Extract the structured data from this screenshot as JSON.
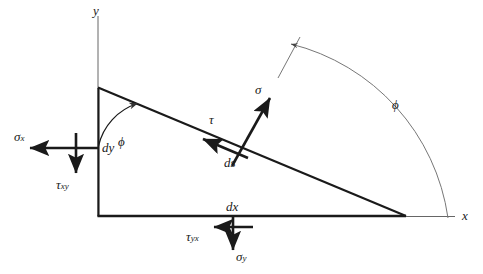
{
  "figure": {
    "kind": "stress-element-free-body-diagram",
    "background_color": "#ffffff",
    "line_color": "#1a1a1a",
    "thin_line_color": "#555555",
    "axes": {
      "y_label": "y",
      "x_label": "x"
    },
    "angles": {
      "vertex_angle_label": "ϕ",
      "arc_angle_label": "ϕ"
    },
    "edge_lengths": {
      "vertical_label": "dy",
      "horizontal_label": "dx",
      "hypotenuse_label": "ds"
    },
    "stresses": [
      {
        "name": "sigma-x",
        "symbol": "σ",
        "subscript": "x",
        "face": "left",
        "direction": "left"
      },
      {
        "name": "tau-xy",
        "symbol": "τ",
        "subscript": "xy",
        "face": "left",
        "direction": "down"
      },
      {
        "name": "sigma-y",
        "symbol": "σ",
        "subscript": "y",
        "face": "bottom",
        "direction": "down"
      },
      {
        "name": "tau-yx",
        "symbol": "τ",
        "subscript": "yx",
        "face": "bottom",
        "direction": "left"
      },
      {
        "name": "sigma-n",
        "symbol": "σ",
        "subscript": "",
        "face": "hypotenuse",
        "direction": "normal-outward"
      },
      {
        "name": "tau-nt",
        "symbol": "τ",
        "subscript": "",
        "face": "hypotenuse",
        "direction": "tangential-up-left"
      }
    ]
  }
}
